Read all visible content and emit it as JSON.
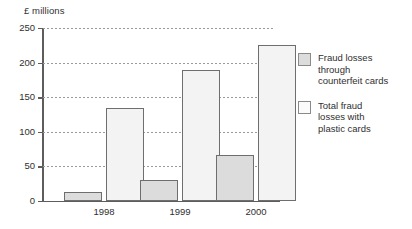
{
  "chart_data": {
    "type": "bar",
    "title": "",
    "subtitle": "",
    "xlabel": "",
    "ylabel": "£ millions",
    "ylim": [
      0,
      250
    ],
    "yticks": [
      0,
      50,
      100,
      150,
      200,
      250
    ],
    "grid": true,
    "legend_position": "right",
    "categories": [
      "1998",
      "1999",
      "2000"
    ],
    "series": [
      {
        "name": "Fraud losses through counterfeit cards",
        "values": [
          13,
          30,
          67
        ],
        "color": "#dcdcdc"
      },
      {
        "name": "Total fraud losses with plastic cards",
        "values": [
          135,
          189,
          225
        ],
        "color": "#f3f3f3"
      }
    ]
  },
  "axis": {
    "y_title": "£ millions",
    "y_tick_labels": [
      "250",
      "200",
      "150",
      "100",
      "50",
      "0"
    ],
    "x_tick_labels": [
      "1998",
      "1999",
      "2000"
    ]
  },
  "legend": {
    "entries": [
      {
        "swatch": "counterfeit",
        "line1": "Fraud losses",
        "line2": "through",
        "line3": "counterfeit cards"
      },
      {
        "swatch": "total",
        "line1": "Total fraud",
        "line2": "losses with",
        "line3": "plastic cards"
      }
    ]
  }
}
